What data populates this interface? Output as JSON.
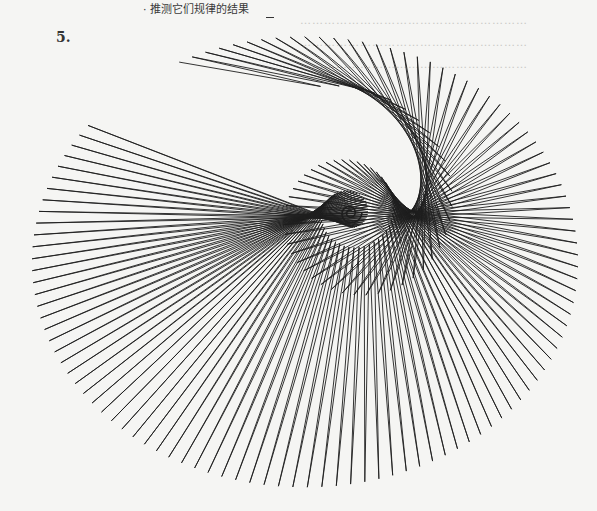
{
  "page": {
    "header_text": "· 推测它们规律的结果",
    "figure_number": "5.",
    "bleed_through_lines": [
      "…………………………………………………",
      "…………………………………………………",
      "…………………………………………………"
    ]
  },
  "figure": {
    "center": [
      350,
      213
    ],
    "outer_radius": 265,
    "outer_center": [
      305,
      262
    ],
    "spokes": 110,
    "spiral_turns": 2.6,
    "stroke_color": "#1e1e1e",
    "background": "#f5f5f3"
  }
}
